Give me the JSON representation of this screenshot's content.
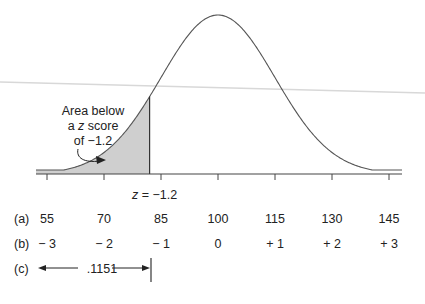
{
  "chart_data": {
    "type": "area",
    "title": "",
    "mean": 100,
    "sd": 15,
    "shaded_region": {
      "from": "-inf",
      "to_z": -1.2,
      "area": ".1151"
    },
    "annotation": {
      "line1": "Area below",
      "line2_pre": "a ",
      "line2_italic": "z",
      "line2_post": " score",
      "line3": "of −1.2"
    },
    "z_marker_label": {
      "italic": "z",
      "rest": " = −1.2"
    },
    "rows": [
      {
        "label": "(a)",
        "values": [
          "55",
          "70",
          "85",
          "100",
          "115",
          "130",
          "145"
        ]
      },
      {
        "label": "(b)",
        "values": [
          "− 3",
          "− 2",
          "− 1",
          "0",
          "+ 1",
          "+ 2",
          "+ 3"
        ]
      },
      {
        "label": "(c)",
        "area_value": ".1151"
      }
    ]
  }
}
